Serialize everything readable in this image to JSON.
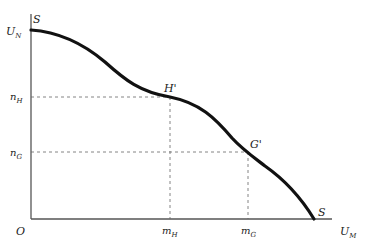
{
  "diagram": {
    "type": "utility-possibility-frontier",
    "axes": {
      "origin_label": "O",
      "y_label": {
        "main": "U",
        "sub": "N"
      },
      "x_label": {
        "main": "U",
        "sub": "M"
      }
    },
    "curve": {
      "name": "SS",
      "start_label": "S",
      "end_label": "S"
    },
    "points": [
      {
        "label": "H'",
        "x_tick": {
          "main": "m",
          "sub": "H"
        },
        "y_tick": {
          "main": "n",
          "sub": "H"
        }
      },
      {
        "label": "G'",
        "x_tick": {
          "main": "m",
          "sub": "G"
        },
        "y_tick": {
          "main": "n",
          "sub": "G"
        }
      }
    ],
    "colors": {
      "axis": "#555555",
      "curve": "#111111",
      "guide": "#666666"
    }
  }
}
